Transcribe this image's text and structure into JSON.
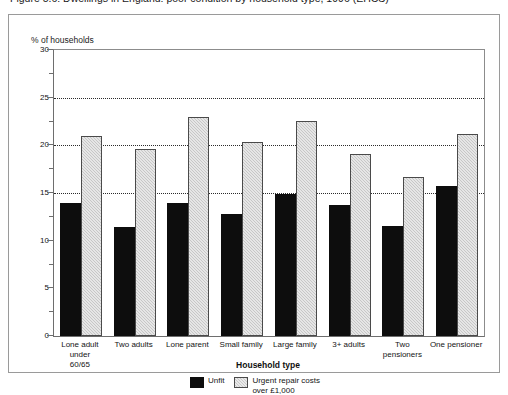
{
  "figure": {
    "title": "Figure 5.6: Dwellings in England: poor condition by household type, 1996 (EHCS)",
    "frame_color": "#9a9a9a"
  },
  "chart_data": {
    "type": "bar",
    "title": "",
    "ylabel": "% of households",
    "xlabel": "Household type",
    "ylim": [
      0,
      30
    ],
    "ytick_step": 5,
    "yticks": [
      0,
      5,
      10,
      15,
      20,
      25,
      30
    ],
    "ytick_labels": [
      "0",
      "5",
      "10",
      "15",
      "20",
      "25",
      "30"
    ],
    "minor_ytick_step": 2.5,
    "gridlines": [
      15,
      20,
      25
    ],
    "grid": "horizontal-dotted",
    "legend_position": "bottom-center",
    "categories": [
      "Lone adult under\n60/65",
      "Two adults",
      "Lone parent",
      "Small family",
      "Large family",
      "3+ adults",
      "Two pensioners",
      "One pensioner"
    ],
    "series": [
      {
        "name": "Unfit",
        "color": "#0d0d0d",
        "values": [
          14.0,
          11.4,
          14.0,
          12.8,
          14.9,
          13.7,
          11.5,
          15.7
        ]
      },
      {
        "name": "Urgent repair costs\nover £1,000",
        "color": "#c7c7c7",
        "values": [
          21.0,
          19.6,
          23.0,
          20.3,
          22.6,
          19.1,
          16.7,
          21.2
        ]
      }
    ]
  }
}
